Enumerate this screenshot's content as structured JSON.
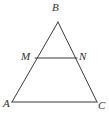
{
  "figure": {
    "kind": "geometry-diagram",
    "background_color": "#ffffff",
    "stroke_color": "#3a3a3a",
    "stroke_width": 1,
    "label_color": "#2f2f2f",
    "width": 109,
    "height": 120
  },
  "points": {
    "B": {
      "label": "B",
      "x": 58,
      "y": 22
    },
    "M": {
      "label": "M",
      "x": 35,
      "y": 58
    },
    "N": {
      "label": "N",
      "x": 77,
      "y": 58
    },
    "A": {
      "label": "A",
      "x": 12,
      "y": 102
    },
    "C": {
      "label": "C",
      "x": 97,
      "y": 102
    }
  },
  "segments": [
    {
      "name": "AB",
      "from": "A",
      "to": "B"
    },
    {
      "name": "BC",
      "from": "B",
      "to": "C"
    },
    {
      "name": "AC",
      "from": "A",
      "to": "C"
    },
    {
      "name": "MN",
      "from": "M",
      "to": "N"
    }
  ]
}
